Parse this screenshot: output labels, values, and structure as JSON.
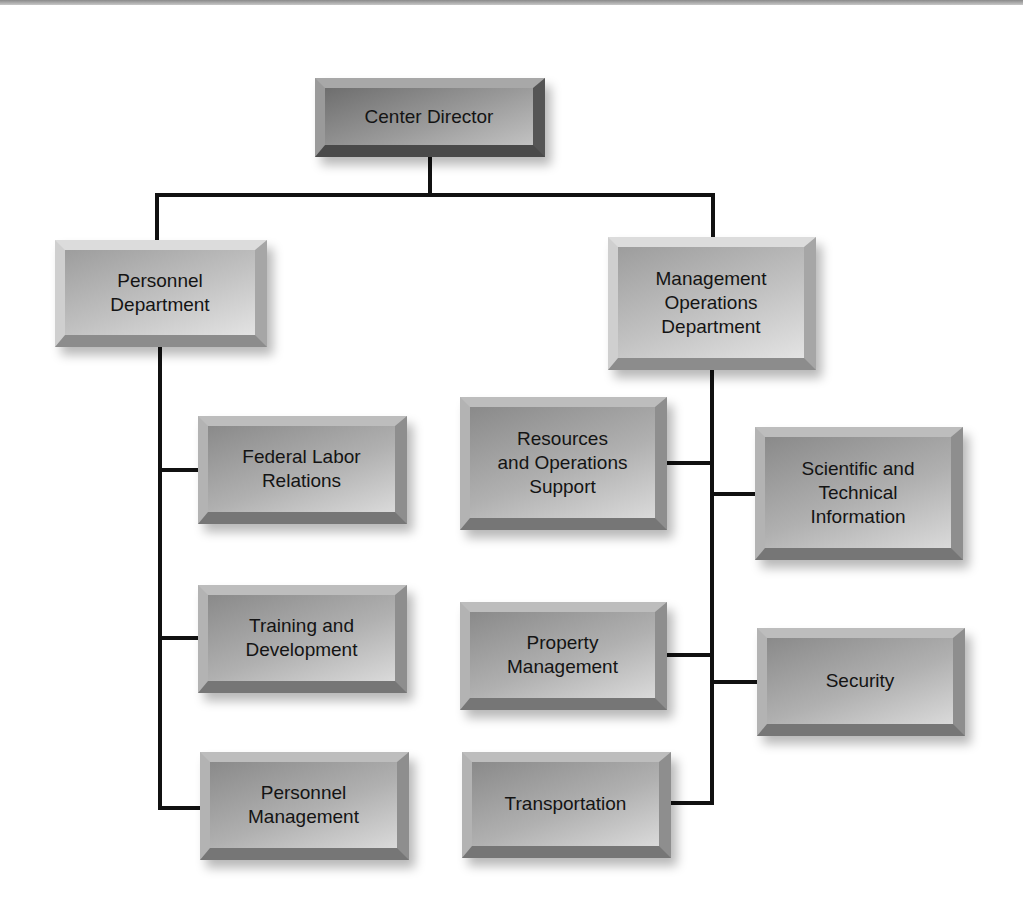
{
  "chart": {
    "type": "org-chart",
    "root": {
      "label": "Center Director",
      "children": [
        {
          "label": "Personnel Department",
          "children": [
            {
              "label": "Federal Labor Relations"
            },
            {
              "label": "Training and Development"
            },
            {
              "label": "Personnel Management"
            }
          ]
        },
        {
          "label": "Management Operations Department",
          "children": [
            {
              "label": "Resources and Operations Support"
            },
            {
              "label": "Scientific and Technical Information"
            },
            {
              "label": "Property Management"
            },
            {
              "label": "Security"
            },
            {
              "label": "Transportation"
            }
          ]
        }
      ]
    }
  },
  "nodes": {
    "center_director": "Center Director",
    "personnel_department": "Personnel\nDepartment",
    "management_operations_department": "Management\nOperations\nDepartment",
    "federal_labor_relations": "Federal Labor\nRelations",
    "training_and_development": "Training and\nDevelopment",
    "personnel_management": "Personnel\nManagement",
    "resources_and_operations_support": "Resources\nand Operations\nSupport",
    "scientific_and_technical_information": "Scientific and\nTechnical\nInformation",
    "property_management": "Property\nManagement",
    "security": "Security",
    "transportation": "Transportation"
  },
  "colors": {
    "connector": "#111111",
    "box_light": "#c2c2c2",
    "box_dark": "#8a8a8a",
    "text": "#141414"
  }
}
